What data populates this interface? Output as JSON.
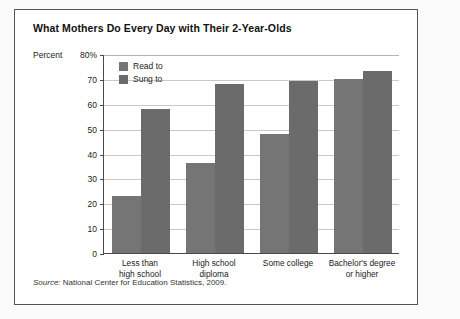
{
  "chart_data": {
    "type": "bar",
    "title": "What Mothers Do Every Day with Their 2-Year-Olds",
    "xlabel": "",
    "ylabel": "Percent",
    "y_unit_label": "Percent",
    "y_top_label": "80%",
    "ylim": [
      0,
      80
    ],
    "ytick_step": 10,
    "grid": true,
    "legend_position": "upper-left-inside",
    "categories": [
      [
        "Less than",
        "high school"
      ],
      [
        "High school",
        "diploma"
      ],
      [
        "Some college"
      ],
      [
        "Bachelor's degree",
        "or higher"
      ]
    ],
    "tick_labels": [
      "0",
      "10",
      "20",
      "30",
      "40",
      "50",
      "60",
      "70",
      "80%"
    ],
    "series": [
      {
        "name": "Read to",
        "color": "#757575",
        "values": [
          23,
          36,
          48,
          70
        ]
      },
      {
        "name": "Sung to",
        "color": "#6b6b6b",
        "values": [
          58,
          68,
          69,
          73
        ]
      }
    ],
    "source": {
      "label": "Source:",
      "text": "National Center for Education Statistics, 2009."
    }
  }
}
